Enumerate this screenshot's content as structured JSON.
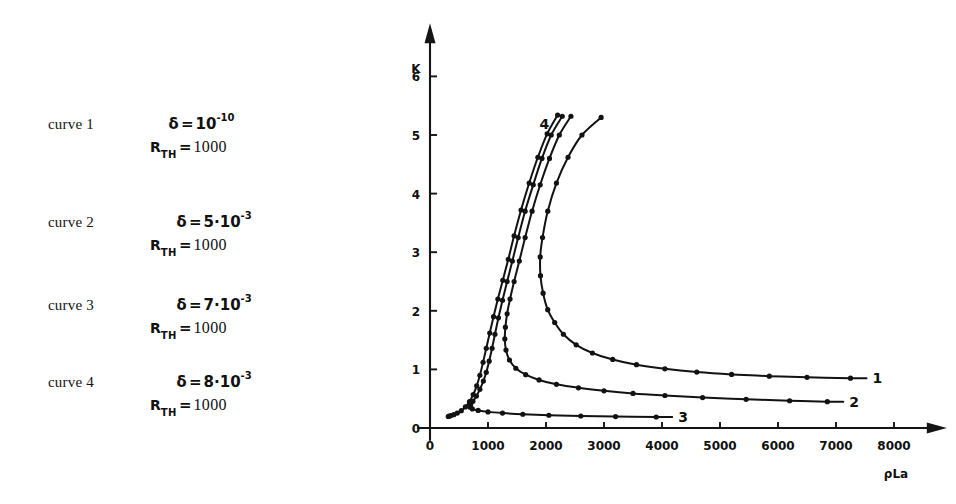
{
  "legend": {
    "entries": [
      {
        "name": "curve 1",
        "param_symbol": "δ",
        "equals": "=",
        "mantissa": "10",
        "exponent": "-10",
        "r_symbol": "R",
        "r_subscript": "TH",
        "r_equals": "=",
        "r_value": "1000"
      },
      {
        "name": "curve 2",
        "param_symbol": "δ",
        "equals": "=",
        "mantissa": "5·10",
        "exponent": "-3",
        "r_symbol": "R",
        "r_subscript": "TH",
        "r_equals": "=",
        "r_value": "1000"
      },
      {
        "name": "curve 3",
        "param_symbol": "δ",
        "equals": "=",
        "mantissa": "7·10",
        "exponent": "-3",
        "r_symbol": "R",
        "r_subscript": "TH",
        "r_equals": "=",
        "r_value": "1000"
      },
      {
        "name": "curve 4",
        "param_symbol": "δ",
        "equals": "=",
        "mantissa": "8·10",
        "exponent": "-3",
        "r_symbol": "R",
        "r_subscript": "TH",
        "r_equals": "=",
        "r_value": "1000"
      }
    ]
  },
  "chart_data": {
    "type": "line",
    "title": "",
    "xlabel": "ρLa",
    "ylabel": "K",
    "xlim": [
      0,
      8600
    ],
    "ylim": [
      0,
      6.6
    ],
    "xticks": [
      0,
      1000,
      2000,
      3000,
      4000,
      5000,
      6000,
      7000,
      8000
    ],
    "xticklabels": [
      "0",
      "1000",
      "2000",
      "3000",
      "4000",
      "5000",
      "6000",
      "7000",
      "8000"
    ],
    "yticks": [
      0,
      1,
      2,
      3,
      4,
      5,
      6
    ],
    "yticklabels": [
      "0",
      "1",
      "2",
      "3",
      "4",
      "5",
      "6"
    ],
    "grid": false,
    "legend_position": "inline-end-labels",
    "axis_arrows": true,
    "marker": "dot",
    "series": [
      {
        "name": "1",
        "label": "1",
        "end_label_value": "1",
        "points": [
          [
            2950,
            5.3
          ],
          [
            2620,
            5.0
          ],
          [
            2380,
            4.62
          ],
          [
            2180,
            4.18
          ],
          [
            2030,
            3.7
          ],
          [
            1940,
            3.25
          ],
          [
            1900,
            2.92
          ],
          [
            1905,
            2.6
          ],
          [
            1950,
            2.3
          ],
          [
            2030,
            2.02
          ],
          [
            2150,
            1.8
          ],
          [
            2300,
            1.6
          ],
          [
            2520,
            1.42
          ],
          [
            2800,
            1.28
          ],
          [
            3150,
            1.17
          ],
          [
            3560,
            1.08
          ],
          [
            4050,
            1.01
          ],
          [
            4600,
            0.955
          ],
          [
            5200,
            0.915
          ],
          [
            5850,
            0.885
          ],
          [
            6500,
            0.865
          ],
          [
            7250,
            0.85
          ]
        ]
      },
      {
        "name": "2",
        "label": "2",
        "end_label_value": "2",
        "points": [
          [
            2430,
            5.32
          ],
          [
            2230,
            5.0
          ],
          [
            2060,
            4.6
          ],
          [
            1900,
            4.15
          ],
          [
            1760,
            3.7
          ],
          [
            1640,
            3.25
          ],
          [
            1540,
            2.85
          ],
          [
            1450,
            2.5
          ],
          [
            1380,
            2.2
          ],
          [
            1330,
            1.95
          ],
          [
            1300,
            1.72
          ],
          [
            1290,
            1.52
          ],
          [
            1310,
            1.33
          ],
          [
            1370,
            1.16
          ],
          [
            1480,
            1.02
          ],
          [
            1650,
            0.91
          ],
          [
            1880,
            0.82
          ],
          [
            2180,
            0.745
          ],
          [
            2560,
            0.685
          ],
          [
            3000,
            0.635
          ],
          [
            3500,
            0.59
          ],
          [
            4050,
            0.555
          ],
          [
            4700,
            0.52
          ],
          [
            5450,
            0.49
          ],
          [
            6200,
            0.465
          ],
          [
            6850,
            0.45
          ]
        ]
      },
      {
        "name": "3",
        "label": "3",
        "end_label_value": "3",
        "points": [
          [
            2280,
            5.32
          ],
          [
            2090,
            5.0
          ],
          [
            1930,
            4.6
          ],
          [
            1780,
            4.15
          ],
          [
            1640,
            3.7
          ],
          [
            1520,
            3.25
          ],
          [
            1420,
            2.85
          ],
          [
            1330,
            2.5
          ],
          [
            1250,
            2.18
          ],
          [
            1180,
            1.88
          ],
          [
            1120,
            1.6
          ],
          [
            1070,
            1.36
          ],
          [
            1020,
            1.14
          ],
          [
            970,
            0.95
          ],
          [
            920,
            0.8
          ],
          [
            860,
            0.66
          ],
          [
            800,
            0.545
          ],
          [
            740,
            0.455
          ],
          [
            700,
            0.395
          ],
          [
            690,
            0.355
          ],
          [
            730,
            0.325
          ],
          [
            830,
            0.3
          ],
          [
            1000,
            0.275
          ],
          [
            1250,
            0.255
          ],
          [
            1600,
            0.235
          ],
          [
            2050,
            0.218
          ],
          [
            2600,
            0.205
          ],
          [
            3200,
            0.195
          ],
          [
            3900,
            0.188
          ]
        ]
      },
      {
        "name": "4",
        "label": "4",
        "end_label_value": "4",
        "points": [
          [
            2200,
            5.34
          ],
          [
            2020,
            5.02
          ],
          [
            1860,
            4.62
          ],
          [
            1710,
            4.18
          ],
          [
            1570,
            3.72
          ],
          [
            1450,
            3.28
          ],
          [
            1350,
            2.88
          ],
          [
            1255,
            2.52
          ],
          [
            1170,
            2.2
          ],
          [
            1095,
            1.9
          ],
          [
            1030,
            1.62
          ],
          [
            970,
            1.36
          ],
          [
            915,
            1.12
          ],
          [
            860,
            0.9
          ],
          [
            805,
            0.72
          ],
          [
            745,
            0.57
          ],
          [
            680,
            0.45
          ],
          [
            610,
            0.36
          ],
          [
            540,
            0.295
          ],
          [
            470,
            0.255
          ],
          [
            410,
            0.228
          ],
          [
            360,
            0.212
          ],
          [
            330,
            0.202
          ],
          [
            315,
            0.196
          ]
        ]
      }
    ],
    "start_stub": {
      "note": "short segments leaving the K axis near K=1.5",
      "value": 1.5
    }
  }
}
